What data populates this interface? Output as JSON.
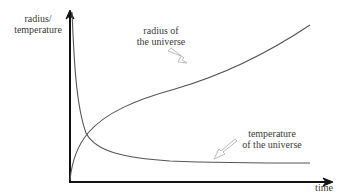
{
  "diagram": {
    "y_axis_label_line1": "radius/",
    "y_axis_label_line2": "temperature",
    "x_axis_label": "time",
    "curves": [
      {
        "name": "radius",
        "label_line1": "radius of",
        "label_line2": "the universe",
        "trend": "increasing"
      },
      {
        "name": "temperature",
        "label_line1": "temperature",
        "label_line2": "of the universe",
        "trend": "decreasing"
      }
    ],
    "colors": {
      "axis": "#111111",
      "curve": "#555555",
      "pointer_arrow": "#bbbbbb"
    }
  }
}
